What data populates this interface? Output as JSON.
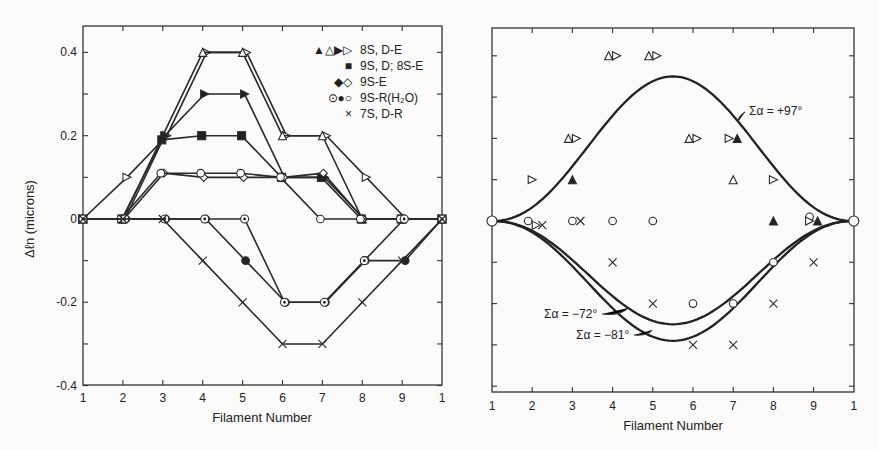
{
  "figure": {
    "left_panel": {
      "ylabel": "Δℓn (microns)",
      "xlabel": "Filament Number",
      "legend": [
        {
          "markers": "▲△▶▷",
          "label": "8S, D-E"
        },
        {
          "markers": "■",
          "label": "9S, D; 8S-E"
        },
        {
          "markers": "◆◇",
          "label": "9S-E"
        },
        {
          "markers": "⊙●○",
          "label": "9S-R(H₂O)"
        },
        {
          "markers": "×",
          "label": "7S, D-R"
        }
      ]
    },
    "right_panel": {
      "xlabel": "Filament Number",
      "annotations": [
        "Σα = +97°",
        "Σα = −72°",
        "Σα = −81°"
      ]
    }
  },
  "chart_data": [
    {
      "type": "line",
      "panel": "left",
      "title": "",
      "xlabel": "Filament Number",
      "ylabel": "Δℓn (microns)",
      "x": [
        "1",
        "2",
        "3",
        "4",
        "5",
        "6",
        "7",
        "8",
        "9",
        "1"
      ],
      "yticks": [
        "0.4",
        "0.2",
        "0",
        "-0.2",
        "-0.4"
      ],
      "ylim": [
        -0.4,
        0.45
      ],
      "grid": false,
      "legend_position": "upper right",
      "series": [
        {
          "name": "8S, D-E (▷ open right triangle)",
          "marker": "tri-right-open",
          "values": [
            0,
            0.1,
            0.2,
            0.4,
            0.4,
            0.2,
            0.2,
            0.1,
            0,
            0
          ]
        },
        {
          "name": "8S, D-E (△ open triangle)",
          "marker": "tri-up-open",
          "values": [
            0,
            0,
            0.2,
            0.4,
            0.4,
            0.2,
            0.2,
            0,
            0,
            0
          ]
        },
        {
          "name": "8S, D-E (▶ filled right triangle)",
          "marker": "tri-right-filled",
          "values": [
            0,
            0,
            0.2,
            0.3,
            0.3,
            0.1,
            0.1,
            0,
            0,
            0
          ]
        },
        {
          "name": "9S, D; 8S-E (■)",
          "marker": "square-filled",
          "values": [
            0,
            0,
            0.19,
            0.2,
            0.2,
            0.1,
            0.1,
            0,
            0,
            0
          ]
        },
        {
          "name": "9S-E (◇)",
          "marker": "diamond-open",
          "values": [
            0,
            0,
            0.11,
            0.1,
            0.1,
            0.1,
            0.11,
            0,
            0,
            0
          ]
        },
        {
          "name": "9S-E (◆/○ drop)",
          "marker": "circle-open",
          "values": [
            0,
            0,
            0.11,
            0.11,
            0.11,
            0.1,
            0,
            0,
            0,
            0
          ]
        },
        {
          "name": "9S-R(H₂O) (●)",
          "marker": "circle-filled",
          "values": [
            0,
            0,
            0,
            0,
            -0.1,
            -0.2,
            -0.2,
            -0.1,
            -0.1,
            0
          ]
        },
        {
          "name": "9S-R(H₂O) (⊙)",
          "marker": "circle-dot",
          "values": [
            0,
            0,
            0,
            0,
            0,
            -0.2,
            -0.2,
            -0.1,
            0,
            0
          ]
        },
        {
          "name": "7S, D-R (×)",
          "marker": "cross",
          "values": [
            0,
            0,
            0,
            -0.1,
            -0.2,
            -0.3,
            -0.3,
            -0.2,
            -0.1,
            0
          ]
        }
      ]
    },
    {
      "type": "scatter",
      "panel": "right",
      "title": "",
      "xlabel": "Filament Number",
      "ylabel": "",
      "x": [
        "1",
        "2",
        "3",
        "4",
        "5",
        "6",
        "7",
        "8",
        "9",
        "1"
      ],
      "ylim": [
        -0.4,
        0.45
      ],
      "grid": false,
      "scatter_points": [
        {
          "x": 4,
          "y": 0.4,
          "marker": "△▷"
        },
        {
          "x": 5,
          "y": 0.4,
          "marker": "△▷"
        },
        {
          "x": 3,
          "y": 0.2,
          "marker": "△▷"
        },
        {
          "x": 6,
          "y": 0.2,
          "marker": "△▷"
        },
        {
          "x": 7,
          "y": 0.2,
          "marker": "▷▲"
        },
        {
          "x": 2,
          "y": 0.1,
          "marker": "▷"
        },
        {
          "x": 3,
          "y": 0.1,
          "marker": "▲"
        },
        {
          "x": 7,
          "y": 0.1,
          "marker": "△"
        },
        {
          "x": 8,
          "y": 0.1,
          "marker": "▷"
        },
        {
          "x": 1.9,
          "y": 0.0,
          "marker": "○"
        },
        {
          "x": 2.1,
          "y": -0.01,
          "marker": "▷"
        },
        {
          "x": 2.25,
          "y": -0.01,
          "marker": "×"
        },
        {
          "x": 3,
          "y": 0.0,
          "marker": "○"
        },
        {
          "x": 3.2,
          "y": 0.0,
          "marker": "×"
        },
        {
          "x": 4,
          "y": 0.0,
          "marker": "○"
        },
        {
          "x": 5,
          "y": 0.0,
          "marker": "○"
        },
        {
          "x": 8,
          "y": 0.0,
          "marker": "▲"
        },
        {
          "x": 8.9,
          "y": 0.01,
          "marker": "○"
        },
        {
          "x": 9,
          "y": 0.0,
          "marker": "▷▲"
        },
        {
          "x": 4,
          "y": -0.1,
          "marker": "×"
        },
        {
          "x": 9,
          "y": -0.1,
          "marker": "×"
        },
        {
          "x": 8,
          "y": -0.1,
          "marker": "○"
        },
        {
          "x": 5,
          "y": -0.2,
          "marker": "×"
        },
        {
          "x": 6,
          "y": -0.2,
          "marker": "○"
        },
        {
          "x": 7,
          "y": -0.2,
          "marker": "○"
        },
        {
          "x": 8,
          "y": -0.2,
          "marker": "×"
        },
        {
          "x": 6,
          "y": -0.3,
          "marker": "×"
        },
        {
          "x": 7,
          "y": -0.3,
          "marker": "×"
        }
      ],
      "curves": [
        {
          "name": "Σα = +97°",
          "peak_x": 5.5,
          "peak_y": 0.35
        },
        {
          "name": "Σα = −72°",
          "min_x": 5.5,
          "min_y": -0.25
        },
        {
          "name": "Σα = −81°",
          "min_x": 5.5,
          "min_y": -0.29
        }
      ]
    }
  ]
}
